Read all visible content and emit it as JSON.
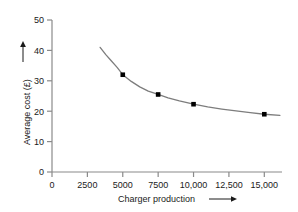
{
  "chart_data": {
    "type": "line",
    "title": "",
    "xlabel": "Charger production",
    "ylabel": "Average cost (£)",
    "xlim": [
      0,
      16250
    ],
    "ylim": [
      0,
      50
    ],
    "grid": false,
    "legend": null,
    "x_tick_labels": [
      "0",
      "2500",
      "5000",
      "7500",
      "10,000",
      "12,500",
      "15,000"
    ],
    "x_tick_values": [
      0,
      2500,
      5000,
      7500,
      10000,
      12500,
      15000
    ],
    "y_tick_labels": [
      "0",
      "10",
      "20",
      "30",
      "40",
      "50"
    ],
    "y_tick_values": [
      0,
      10,
      20,
      30,
      40,
      50
    ],
    "series": [
      {
        "name": "Average cost",
        "marker": "filled-square",
        "marker_color": "#000000",
        "line_color": "#7d7d7d",
        "x": [
          5000,
          7500,
          10000,
          15000
        ],
        "values": [
          32,
          25.5,
          22.3,
          19
        ]
      }
    ],
    "curve_points": {
      "x": [
        3400,
        3800,
        4200,
        4600,
        5000,
        5600,
        6200,
        6800,
        7500,
        8200,
        9000,
        10000,
        11000,
        12000,
        13000,
        14000,
        15000,
        16100
      ],
      "y": [
        41.0,
        38.6,
        36.5,
        34.4,
        32.0,
        29.8,
        28.0,
        26.6,
        25.5,
        24.4,
        23.4,
        22.3,
        21.4,
        20.7,
        20.1,
        19.5,
        19.0,
        18.6
      ]
    },
    "x_axis_arrow": true,
    "y_axis_arrow": true
  },
  "icons": {
    "x_arrow": "arrow-right-icon",
    "y_arrow": "arrow-up-icon"
  }
}
